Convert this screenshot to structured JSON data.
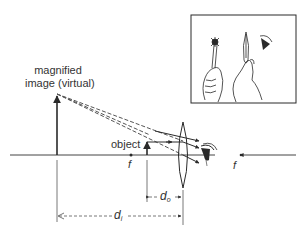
{
  "labels": {
    "magnified_line1": "magnified",
    "magnified_line2": "image (virtual)",
    "object": "object",
    "focal_left": "f",
    "focal_right": "f",
    "d_o_main": "d",
    "d_o_sub": "o",
    "d_i_main": "d",
    "d_i_sub": "i"
  },
  "inset": {
    "description": "hand holding object near a magnifying lens held by another hand, viewed by an eye",
    "icons": [
      "object-held-in-hand-icon",
      "lens-in-hand-icon",
      "eye-icon"
    ]
  },
  "colors": {
    "line": "#2a2a2a",
    "dashed": "#555555",
    "background": "#ffffff"
  }
}
